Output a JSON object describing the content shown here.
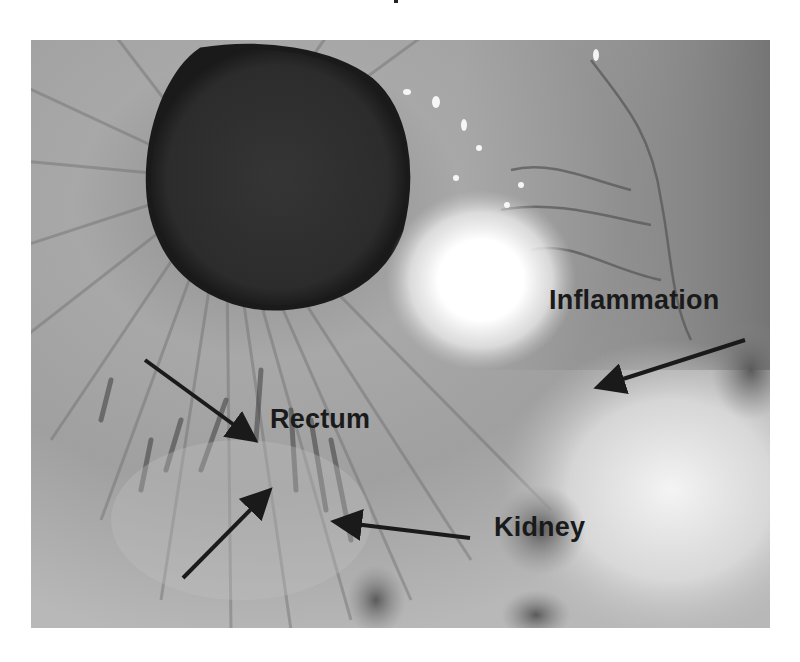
{
  "figure": {
    "labels": {
      "inflammation": "Inflammation",
      "rectum": "Rectum",
      "kidney": "Kidney"
    },
    "arrows": [
      {
        "name": "rectum-arrow-upper",
        "from": [
          145,
          360
        ],
        "to": [
          255,
          440
        ]
      },
      {
        "name": "rectum-arrow-lower",
        "from": [
          183,
          578
        ],
        "to": [
          270,
          490
        ]
      },
      {
        "name": "kidney-arrow",
        "from": [
          470,
          538
        ],
        "to": [
          335,
          522
        ]
      },
      {
        "name": "inflammation-arrow",
        "from": [
          745,
          340
        ],
        "to": [
          598,
          387
        ]
      }
    ],
    "colors": {
      "background": "#ffffff",
      "label_text": "#1a1a1a",
      "arrow": "#1a1a1a",
      "pupil": "#2e2e2e",
      "iris": "#9c9c9c",
      "glare": "#ffffff"
    }
  }
}
